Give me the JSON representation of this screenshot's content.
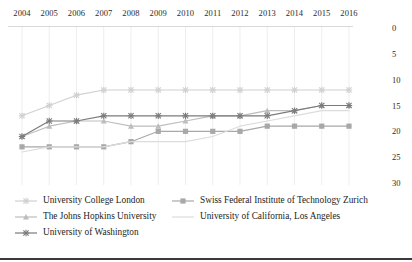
{
  "chart_data": {
    "type": "line",
    "title": "",
    "xlabel": "",
    "ylabel": "",
    "x": [
      2004,
      2005,
      2006,
      2007,
      2008,
      2009,
      2010,
      2011,
      2012,
      2013,
      2014,
      2015,
      2016
    ],
    "categories": [
      "2004",
      "2005",
      "2006",
      "2007",
      "2008",
      "2009",
      "2010",
      "2011",
      "2012",
      "2013",
      "2014",
      "2015",
      "2016"
    ],
    "xlim": [
      2004,
      2016
    ],
    "ylim": [
      0,
      30
    ],
    "y_inverted": true,
    "y_ticks": [
      0,
      5,
      10,
      15,
      20,
      25,
      30
    ],
    "y_tick_labels": [
      "0",
      "5",
      "10",
      "15",
      "20",
      "25",
      "30"
    ],
    "grid": "vertical",
    "legend_position": "bottom-left",
    "series": [
      {
        "name": "University College London",
        "color": "#d0d0d0",
        "marker": "cross",
        "values": [
          17,
          15,
          13,
          12,
          12,
          12,
          12,
          12,
          12,
          12,
          12,
          12,
          12
        ]
      },
      {
        "name": "Swiss Federal Institute of Technology Zurich",
        "color": "#a8a8a8",
        "marker": "square",
        "values": [
          23,
          23,
          23,
          23,
          22,
          20,
          20,
          20,
          20,
          19,
          19,
          19,
          19
        ]
      },
      {
        "name": "The Johns Hopkins University",
        "color": "#bdbdbd",
        "marker": "triangle",
        "values": [
          21,
          19,
          18,
          18,
          19,
          19,
          18,
          17,
          17,
          16,
          16,
          15,
          15
        ]
      },
      {
        "name": "University of California, Los Angeles",
        "color": "#dcdcdc",
        "marker": "none",
        "values": [
          24,
          23,
          23,
          23,
          22,
          22,
          22,
          21,
          19,
          18,
          17,
          16,
          16
        ]
      },
      {
        "name": "University of Washington",
        "color": "#7b7b7b",
        "marker": "cross",
        "values": [
          21,
          18,
          18,
          17,
          17,
          17,
          17,
          17,
          17,
          17,
          16,
          15,
          15
        ]
      }
    ]
  },
  "legend": {
    "items": [
      {
        "label": "University College London"
      },
      {
        "label": "Swiss Federal Institute of Technology Zurich"
      },
      {
        "label": "The Johns Hopkins University"
      },
      {
        "label": "University of California, Los Angeles"
      },
      {
        "label": "University of Washington"
      }
    ]
  }
}
